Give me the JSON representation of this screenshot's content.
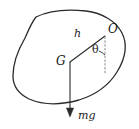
{
  "figure": {
    "type": "free-body-diagram",
    "background_color": "#ffffff",
    "stroke_color": "#2b2b2b",
    "labels": {
      "pivot": "O",
      "distance": "h",
      "angle": "θ",
      "centre_of_gravity": "G",
      "weight": "mg"
    },
    "geometry": {
      "point_O": [
        106,
        36
      ],
      "point_G": [
        70,
        62
      ],
      "weight_arrow_tip": [
        70,
        116
      ],
      "dotted_line_from": [
        106,
        36
      ],
      "dotted_line_to": [
        106,
        72
      ],
      "body_outline": "M 34,18 C 48,10 66,9 84,11 C 100,13 115,20 122,32 C 128,44 126,58 118,71 C 110,84 96,94 80,99 C 62,104 44,104 30,98 C 20,94 14,86 13,76 C 12,64 17,50 24,38 C 27,31 30,23 34,18 Z"
    }
  }
}
